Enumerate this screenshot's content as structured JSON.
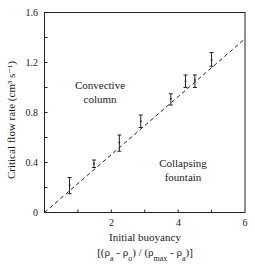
{
  "chart_data": {
    "type": "scatter",
    "title": "",
    "xlabel": "Initial buoyancy",
    "xlabel_line2": "[(ρa - ρo) / (ρmax - ρa)]",
    "ylabel": "Critical flow rate (cm³ s⁻¹)",
    "xlim": [
      0,
      6
    ],
    "ylim": [
      0,
      1.6
    ],
    "x_ticks": [
      0,
      2,
      4,
      6
    ],
    "x_minor_ticks": [
      1,
      3,
      5
    ],
    "y_ticks": [
      0,
      0.4,
      0.8,
      1.2,
      1.6
    ],
    "y_minor_ticks": [
      0.2,
      0.6,
      1.0,
      1.4
    ],
    "grid": false,
    "legend": null,
    "series": [
      {
        "name": "Measured critical flow rate",
        "style": "error bars",
        "points": [
          {
            "x": 0.75,
            "y": 0.22,
            "ylow": 0.15,
            "yhigh": 0.28
          },
          {
            "x": 1.48,
            "y": 0.39,
            "ylow": 0.36,
            "yhigh": 0.42
          },
          {
            "x": 2.24,
            "y": 0.56,
            "ylow": 0.49,
            "yhigh": 0.62
          },
          {
            "x": 2.88,
            "y": 0.73,
            "ylow": 0.68,
            "yhigh": 0.78
          },
          {
            "x": 3.78,
            "y": 0.91,
            "ylow": 0.86,
            "yhigh": 0.95
          },
          {
            "x": 4.22,
            "y": 1.05,
            "ylow": 1.0,
            "yhigh": 1.1
          },
          {
            "x": 4.5,
            "y": 1.06,
            "ylow": 1.0,
            "yhigh": 1.1
          },
          {
            "x": 5.0,
            "y": 1.22,
            "ylow": 1.17,
            "yhigh": 1.28
          }
        ]
      },
      {
        "name": "Regime boundary (dashed fit)",
        "style": "dashed line",
        "x": [
          0,
          6
        ],
        "y": [
          0,
          1.39
        ]
      }
    ],
    "annotations": [
      {
        "text": "Convective column",
        "lines": [
          "Convective",
          "column"
        ],
        "x": 1.7,
        "y": 0.95
      },
      {
        "text": "Collapsing fountain",
        "lines": [
          "Collapsing",
          "fountain"
        ],
        "x": 4.15,
        "y": 0.33
      }
    ]
  },
  "labels": {
    "y_tick_0": "0",
    "y_tick_04": "0.4",
    "y_tick_08": "0.8",
    "y_tick_12": "1.2",
    "y_tick_16": "1.6",
    "x_tick_2": "2",
    "x_tick_4": "4",
    "x_tick_6": "6",
    "xlabel": "Initial buoyancy",
    "region_convective_1": "Convective",
    "region_convective_2": "column",
    "region_collapsing_1": "Collapsing",
    "region_collapsing_2": "fountain"
  }
}
